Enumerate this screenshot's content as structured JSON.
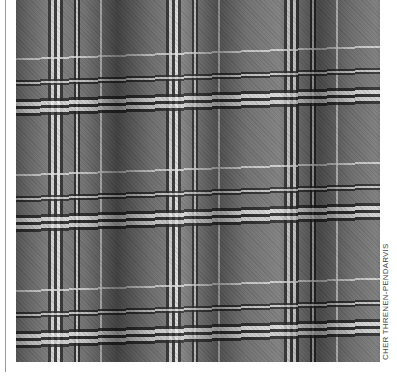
{
  "image": {
    "description": "Grayscale draped tartan/plaid fabric with wavy folds",
    "alt": "Plaid fabric draped in vertical folds"
  },
  "credit": "CHER THRENEN-PENDARVIS",
  "colors": {
    "dark_stripe": "#222222",
    "light_stripe": "#e8e8e8",
    "base_check": "#7a7a7a",
    "fold_shadow": "#1a1a1a"
  }
}
